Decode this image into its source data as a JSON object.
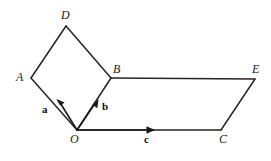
{
  "figure": {
    "type": "vector-geometry-diagram",
    "background_color": "#ffffff",
    "stroke_color": "#252525",
    "stroke_width": 1.5,
    "width": 271,
    "height": 161
  },
  "points": {
    "A": {
      "label": "A",
      "x": 31,
      "y": 78,
      "label_x": 16,
      "label_y": 71
    },
    "B": {
      "label": "B",
      "x": 111,
      "y": 78,
      "label_x": 113,
      "label_y": 63
    },
    "C": {
      "label": "C",
      "x": 221,
      "y": 130,
      "label_x": 219,
      "label_y": 133
    },
    "D": {
      "label": "D",
      "x": 66,
      "y": 26,
      "label_x": 61,
      "label_y": 9
    },
    "E": {
      "label": "E",
      "x": 255,
      "y": 79,
      "label_x": 252,
      "label_y": 63
    },
    "O": {
      "label": "O",
      "x": 77,
      "y": 130,
      "label_x": 70,
      "label_y": 133
    }
  },
  "edges": [
    {
      "name": "edge-A-D",
      "from": "A",
      "to": "D"
    },
    {
      "name": "edge-D-B",
      "from": "D",
      "to": "B"
    },
    {
      "name": "edge-A-O",
      "from": "A",
      "to": "O"
    },
    {
      "name": "edge-O-B",
      "from": "O",
      "to": "B"
    },
    {
      "name": "edge-B-E",
      "from": "B",
      "to": "E"
    },
    {
      "name": "edge-E-C",
      "from": "E",
      "to": "C"
    },
    {
      "name": "edge-C-O",
      "from": "C",
      "to": "O"
    }
  ],
  "vectors": [
    {
      "name": "vector-a",
      "label": "a",
      "from": "O",
      "toward": "A",
      "tip_x": 57,
      "tip_y": 100,
      "label_x": 42,
      "label_y": 104
    },
    {
      "name": "vector-b",
      "label": "b",
      "from": "O",
      "toward": "B",
      "tip_x": 98,
      "tip_y": 100,
      "label_x": 102,
      "label_y": 101
    },
    {
      "name": "vector-c",
      "label": "c",
      "from": "O",
      "toward": "C",
      "tip_x": 154,
      "tip_y": 130,
      "label_x": 144,
      "label_y": 134
    }
  ]
}
